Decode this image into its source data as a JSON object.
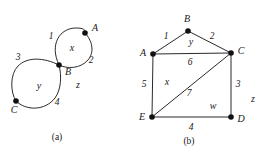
{
  "figure_a": {
    "caption": "(a)",
    "vertices": [
      {
        "id": "A",
        "label": "A",
        "x": 85,
        "y": 33,
        "label_x": 95,
        "label_y": 28
      },
      {
        "id": "B",
        "label": "B",
        "x": 59,
        "y": 65,
        "label_x": 68,
        "label_y": 72
      },
      {
        "id": "C",
        "label": "C",
        "x": 16,
        "y": 101,
        "label_x": 14,
        "label_y": 110
      }
    ],
    "edge_labels": [
      {
        "text": "1",
        "x": 51,
        "y": 37
      },
      {
        "text": "2",
        "x": 91,
        "y": 61
      },
      {
        "text": "3",
        "x": 18,
        "y": 58
      },
      {
        "text": "4",
        "x": 57,
        "y": 103
      }
    ],
    "face_labels": [
      {
        "text": "x",
        "x": 72,
        "y": 48
      },
      {
        "text": "y",
        "x": 39,
        "y": 86
      },
      {
        "text": "z",
        "x": 78,
        "y": 85
      }
    ],
    "caption_x": 57,
    "caption_y": 137
  },
  "figure_b": {
    "caption": "(b)",
    "vertices": [
      {
        "id": "B",
        "label": "B",
        "x": 57,
        "y": 31,
        "label_x": 56,
        "label_y": 19
      },
      {
        "id": "A",
        "label": "A",
        "x": 22,
        "y": 54,
        "label_x": 12,
        "label_y": 53
      },
      {
        "id": "C",
        "label": "C",
        "x": 100,
        "y": 53,
        "label_x": 110,
        "label_y": 51
      },
      {
        "id": "E",
        "label": "E",
        "x": 21,
        "y": 117,
        "label_x": 11,
        "label_y": 117
      },
      {
        "id": "D",
        "label": "D",
        "x": 100,
        "y": 117,
        "label_x": 110,
        "label_y": 119
      }
    ],
    "edges": [
      {
        "from": "A",
        "to": "B",
        "label": "1"
      },
      {
        "from": "B",
        "to": "C",
        "label": "2"
      },
      {
        "from": "A",
        "to": "C",
        "label": "6"
      },
      {
        "from": "C",
        "to": "D",
        "label": "3"
      },
      {
        "from": "E",
        "to": "D",
        "label": "4"
      },
      {
        "from": "A",
        "to": "E",
        "label": "5"
      },
      {
        "from": "E",
        "to": "C",
        "label": "7"
      }
    ],
    "edge_labels": [
      {
        "text": "1",
        "x": 35,
        "y": 37
      },
      {
        "text": "2",
        "x": 81,
        "y": 37
      },
      {
        "text": "6",
        "x": 59,
        "y": 63
      },
      {
        "text": "3",
        "x": 107,
        "y": 85
      },
      {
        "text": "4",
        "x": 60,
        "y": 128
      },
      {
        "text": "5",
        "x": 13,
        "y": 85
      },
      {
        "text": "7",
        "x": 58,
        "y": 94
      }
    ],
    "face_labels": [
      {
        "text": "y",
        "x": 60,
        "y": 42
      },
      {
        "text": "x",
        "x": 36,
        "y": 82
      },
      {
        "text": "w",
        "x": 82,
        "y": 106
      },
      {
        "text": "z",
        "x": 122,
        "y": 99
      }
    ],
    "caption_x": 58,
    "caption_y": 141
  },
  "colors": {
    "stroke": "#2a2a2a",
    "vertex": "#111111",
    "text": "#1a1a1a",
    "background": "#ffffff"
  }
}
